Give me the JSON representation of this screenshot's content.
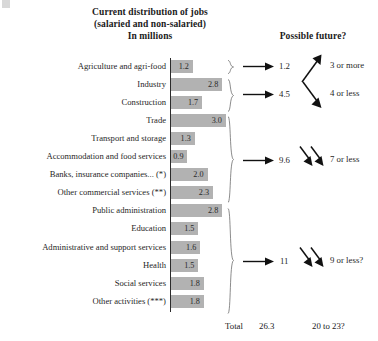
{
  "titles": {
    "left_line1": "Current distribution of jobs",
    "left_line2": "(salaried and non-salaried)",
    "left_line3": "In millions",
    "right": "Possible future?"
  },
  "chart_data": {
    "type": "bar",
    "title": "Current distribution of jobs (salaried and non-salaried) In millions",
    "xlabel": "",
    "ylabel": "",
    "orientation": "horizontal",
    "xlim": [
      0,
      3.2
    ],
    "grid": false,
    "legend": "none",
    "unit": "millions",
    "categories": [
      "Agriculture and agri-food",
      "Industry",
      "Construction",
      "Trade",
      "Transport and storage",
      "Accommodation and food services",
      "Banks, insurance companies... (*)",
      "Other commercial services (**)",
      "Public administration",
      "Education",
      "Administrative and support services",
      "Health",
      "Social services",
      "Other activities (***)"
    ],
    "values": [
      1.2,
      2.8,
      1.7,
      3.0,
      1.3,
      0.9,
      2.0,
      2.3,
      2.8,
      1.5,
      1.6,
      1.5,
      1.8,
      1.8
    ],
    "value_labels": [
      "1.2",
      "2.8",
      "1.7",
      "3.0",
      "1.3",
      "0.9",
      "2.0",
      "2.3",
      "2.8",
      "1.5",
      "1.6",
      "1.5",
      "1.8",
      "1.8"
    ],
    "groups": [
      {
        "name": "group-1",
        "members": [
          "Agriculture and agri-food"
        ],
        "current": "1.2",
        "future": "3 or more",
        "trend": "up"
      },
      {
        "name": "group-2",
        "members": [
          "Industry",
          "Construction"
        ],
        "current": "4.5",
        "future": "4 or less",
        "trend": "down"
      },
      {
        "name": "group-3",
        "members": [
          "Trade",
          "Transport and storage",
          "Accommodation and food services",
          "Banks, insurance companies... (*)",
          "Other commercial services (**)"
        ],
        "current": "9.6",
        "future": "7 or less",
        "trend": "down-double"
      },
      {
        "name": "group-4",
        "members": [
          "Public administration",
          "Education",
          "Administrative and support services",
          "Health",
          "Social services",
          "Other activities (***)"
        ],
        "current": "11",
        "future": "9 or less?",
        "trend": "down-double"
      }
    ],
    "total": {
      "label": "Total",
      "value": "26.3",
      "future": "20 to 23?"
    }
  },
  "rows": [
    {
      "label": "Agriculture and agri-food",
      "value": "1.2"
    },
    {
      "label": "Industry",
      "value": "2.8"
    },
    {
      "label": "Construction",
      "value": "1.7"
    },
    {
      "label": "Trade",
      "value": "3.0"
    },
    {
      "label": "Transport and storage",
      "value": "1.3"
    },
    {
      "label": "Accommodation and food services",
      "value": "0.9"
    },
    {
      "label": "Banks, insurance companies... (*)",
      "value": "2.0"
    },
    {
      "label": "Other commercial services (**)",
      "value": "2.3"
    },
    {
      "label": "Public administration",
      "value": "2.8"
    },
    {
      "label": "Education",
      "value": "1.5"
    },
    {
      "label": "Administrative and support services",
      "value": "1.6"
    },
    {
      "label": "Health",
      "value": "1.5"
    },
    {
      "label": "Social services",
      "value": "1.8"
    },
    {
      "label": "Other activities (***)",
      "value": "1.8"
    }
  ],
  "groups": [
    {
      "current": "1.2",
      "future": "3 or more"
    },
    {
      "current": "4.5",
      "future": "4 or less"
    },
    {
      "current": "9.6",
      "future": "7 or less"
    },
    {
      "current": "11",
      "future": "9 or less?"
    }
  ],
  "total": {
    "label": "Total",
    "value": "26.3",
    "future": "20 to 23?"
  },
  "colors": {
    "bar": "#b2b2b2",
    "text": "#1f1f1f",
    "axis": "#2b2b2b",
    "background": "#ffffff"
  }
}
